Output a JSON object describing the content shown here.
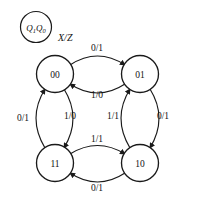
{
  "diagram": {
    "title_legend": {
      "state_encoding": "Q1Q0",
      "state_encoding_main": "Q",
      "state_encoding_sub1": "1",
      "state_encoding_main2": "Q",
      "state_encoding_sub2": "0",
      "io_notation": "X/Z"
    },
    "colors": {
      "stroke": "#1a1a1a",
      "text": "#111111",
      "background": "#ffffff"
    },
    "states": [
      {
        "id": "s00",
        "label": "00",
        "position": "top-left",
        "cx": 55,
        "cy": 74
      },
      {
        "id": "s01",
        "label": "01",
        "position": "top-right",
        "cx": 140,
        "cy": 74
      },
      {
        "id": "s11",
        "label": "11",
        "position": "bottom-left",
        "cx": 55,
        "cy": 163
      },
      {
        "id": "s10",
        "label": "10",
        "position": "bottom-right",
        "cx": 140,
        "cy": 163
      }
    ],
    "transitions": [
      {
        "id": "t-00-01",
        "from": "00",
        "to": "01",
        "label": "0/1",
        "input": "0",
        "output": "1",
        "side": "top-outer"
      },
      {
        "id": "t-01-00",
        "from": "01",
        "to": "00",
        "label": "1/0",
        "input": "1",
        "output": "0",
        "side": "top-inner"
      },
      {
        "id": "t-11-00",
        "from": "11",
        "to": "00",
        "label": "0/1",
        "input": "0",
        "output": "1",
        "side": "left-outer"
      },
      {
        "id": "t-00-11",
        "from": "00",
        "to": "11",
        "label": "1/0",
        "input": "1",
        "output": "0",
        "side": "left-inner"
      },
      {
        "id": "t-10-01",
        "from": "10",
        "to": "01",
        "label": "1/1",
        "input": "1",
        "output": "1",
        "side": "right-inner"
      },
      {
        "id": "t-01-10",
        "from": "01",
        "to": "10",
        "label": "0/1",
        "input": "0",
        "output": "1",
        "side": "right-outer"
      },
      {
        "id": "t-11-10",
        "from": "11",
        "to": "10",
        "label": "1/1",
        "input": "1",
        "output": "1",
        "side": "bottom-inner"
      },
      {
        "id": "t-10-11",
        "from": "10",
        "to": "11",
        "label": "0/1",
        "input": "0",
        "output": "1",
        "side": "bottom-outer"
      }
    ],
    "edge_label_positions": {
      "top_outer": {
        "x": 97,
        "y": 48
      },
      "top_inner": {
        "x": 97,
        "y": 95
      },
      "left_outer": {
        "x": 23,
        "y": 118
      },
      "left_inner": {
        "x": 70,
        "y": 116
      },
      "right_inner": {
        "x": 113,
        "y": 116
      },
      "right_outer": {
        "x": 163,
        "y": 116
      },
      "bottom_inner": {
        "x": 97,
        "y": 139
      },
      "bottom_outer": {
        "x": 97,
        "y": 188
      }
    }
  }
}
